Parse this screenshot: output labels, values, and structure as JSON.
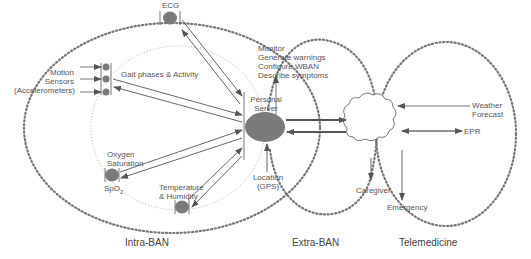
{
  "diagram": {
    "colors": {
      "node": "#7a7a7a",
      "line": "#555555",
      "dots": "#777777",
      "text": "#555555"
    },
    "regions": {
      "intra": "Intra-BAN",
      "extra": "Extra-BAN",
      "tele": "Telemedicine"
    },
    "nodes": {
      "ecg": "ECG",
      "motion": [
        "Motion",
        "Sensors",
        "(Accelerometers)"
      ],
      "gait": "Gait phases & Activity",
      "oxygen": [
        "Oxygen",
        "Saturation"
      ],
      "spo2": "SpO",
      "spo2_sub": "2",
      "temp": [
        "Temperature",
        "& Humidity"
      ],
      "server": [
        "Personal",
        "Server"
      ],
      "location": [
        "Location",
        "(GPS)"
      ],
      "functions": [
        "Monitor",
        "Generate warnings",
        "Configure WBAN",
        "Describe symptoms"
      ],
      "weather": [
        "Weather",
        "Forecast"
      ],
      "epr": "EPR",
      "caregiver": "Caregiver",
      "emergency": "Emergency"
    }
  }
}
